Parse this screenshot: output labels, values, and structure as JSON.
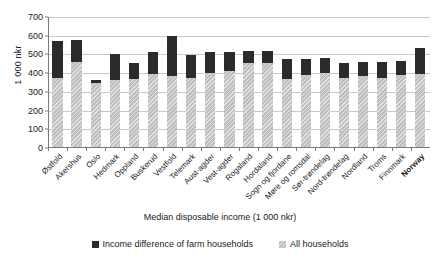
{
  "chart_data": {
    "type": "bar",
    "stacked": true,
    "title": "",
    "xlabel": "Median disposable income (1 000 nkr)",
    "ylabel": "1 000 nkr",
    "ylim": [
      0,
      700
    ],
    "ytick_step": 100,
    "yticks": [
      700,
      600,
      500,
      400,
      300,
      200,
      100,
      0
    ],
    "grid": true,
    "legend_position": "bottom",
    "categories": [
      "Østfold",
      "Akershus",
      "Oslo",
      "Hedmark",
      "Oppland",
      "Buskerud",
      "Vestfold",
      "Telemark",
      "Aust-agder",
      "Vest-agder",
      "Rogaland",
      "Hordaland",
      "Sogn og fjordane",
      "Møre og romsdal",
      "Sør-trøndelag",
      "Nord-trøndelag",
      "Nordland",
      "Troms",
      "Finnmark",
      "Norway"
    ],
    "highlight_category": "Norway",
    "series": [
      {
        "name": "All households",
        "color": "#bfbfbf",
        "values": [
          373,
          462,
          350,
          362,
          367,
          396,
          383,
          372,
          400,
          412,
          453,
          452,
          370,
          390,
          400,
          372,
          385,
          375,
          388,
          398
        ]
      },
      {
        "name": "Income difference of farm households",
        "color": "#2b2b2b",
        "values": [
          197,
          116,
          12,
          139,
          88,
          118,
          217,
          125,
          113,
          103,
          63,
          68,
          105,
          87,
          83,
          82,
          73,
          82,
          77,
          134
        ]
      }
    ],
    "totals": [
      570,
      578,
      362,
      501,
      455,
      514,
      600,
      497,
      513,
      515,
      516,
      520,
      475,
      477,
      483,
      454,
      458,
      457,
      465,
      532
    ]
  },
  "legend": {
    "items": [
      {
        "label": "Income difference of farm households",
        "swatch": "dark"
      },
      {
        "label": "All households",
        "swatch": "light"
      }
    ]
  }
}
